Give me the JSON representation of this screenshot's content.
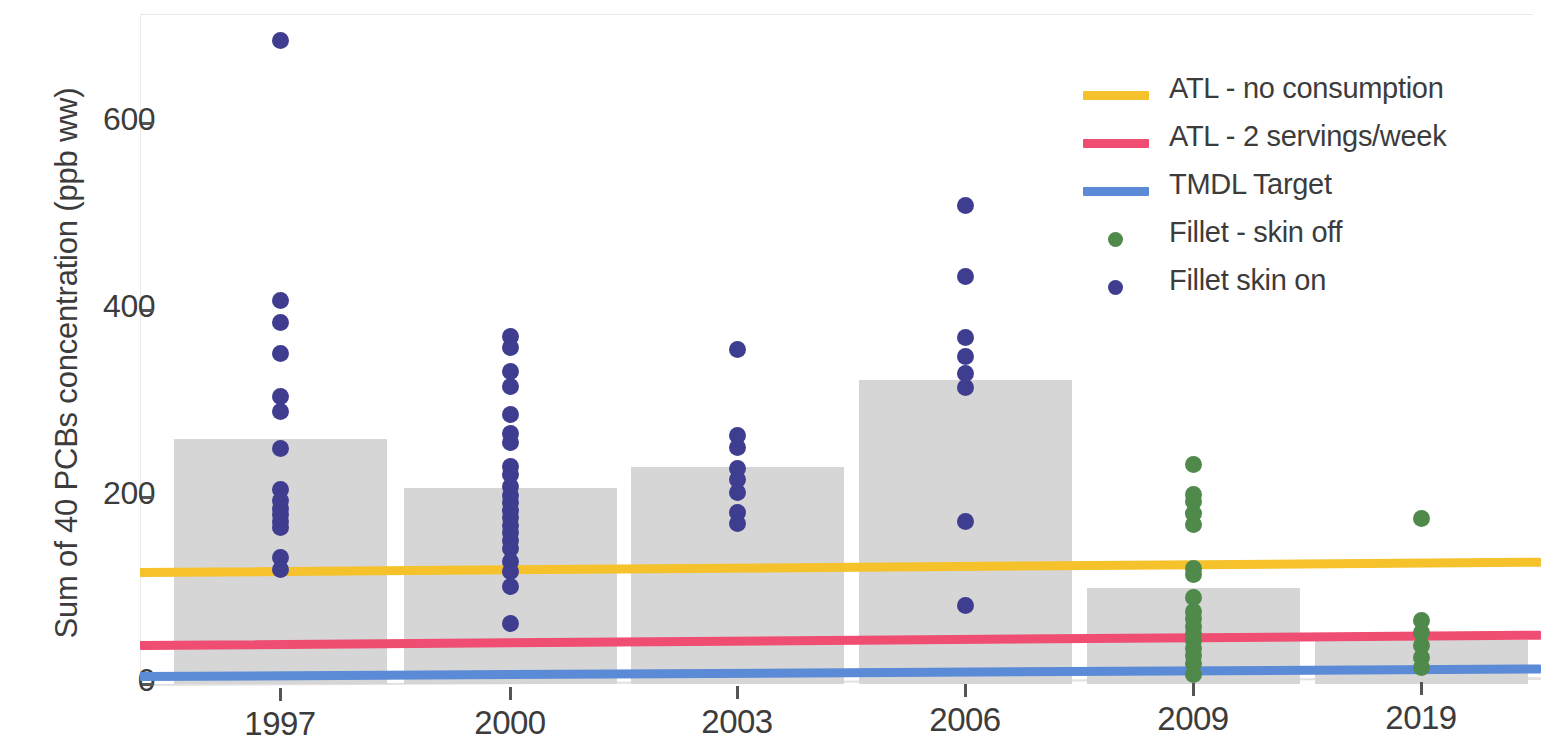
{
  "chart_data": {
    "type": "bar",
    "title": "",
    "xlabel": "",
    "ylabel": "Sum of 40 PCBs concentration (ppb ww)",
    "categories": [
      "1997",
      "2000",
      "2003",
      "2006",
      "2009",
      "2019"
    ],
    "values": [
      262,
      210,
      232,
      325,
      103,
      47
    ],
    "ylim": [
      0,
      700
    ],
    "yticks": [
      0,
      200,
      400,
      600
    ],
    "ytick_labels": [
      "0",
      "200",
      "400",
      "600"
    ],
    "grid": false,
    "legend_position": "top-right",
    "bar_color": "#d4d4d4",
    "series": [
      {
        "name": "Bar - mean concentration",
        "type": "bar",
        "categories": [
          "1997",
          "2000",
          "2003",
          "2006",
          "2009",
          "2019"
        ],
        "values": [
          262,
          210,
          232,
          325,
          103,
          47
        ]
      },
      {
        "name": "Fillet skin on",
        "type": "scatter",
        "color": "#3f3d8f",
        "points": [
          {
            "x": "1997",
            "y": 688
          },
          {
            "x": "1997",
            "y": 410
          },
          {
            "x": "1997",
            "y": 387
          },
          {
            "x": "1997",
            "y": 353
          },
          {
            "x": "1997",
            "y": 307
          },
          {
            "x": "1997",
            "y": 291
          },
          {
            "x": "1997",
            "y": 252
          },
          {
            "x": "1997",
            "y": 208
          },
          {
            "x": "1997",
            "y": 196
          },
          {
            "x": "1997",
            "y": 188
          },
          {
            "x": "1997",
            "y": 181
          },
          {
            "x": "1997",
            "y": 174
          },
          {
            "x": "1997",
            "y": 167
          },
          {
            "x": "1997",
            "y": 135
          },
          {
            "x": "1997",
            "y": 122
          },
          {
            "x": "2000",
            "y": 372
          },
          {
            "x": "2000",
            "y": 360
          },
          {
            "x": "2000",
            "y": 334
          },
          {
            "x": "2000",
            "y": 318
          },
          {
            "x": "2000",
            "y": 288
          },
          {
            "x": "2000",
            "y": 268
          },
          {
            "x": "2000",
            "y": 258
          },
          {
            "x": "2000",
            "y": 233
          },
          {
            "x": "2000",
            "y": 224
          },
          {
            "x": "2000",
            "y": 211
          },
          {
            "x": "2000",
            "y": 202
          },
          {
            "x": "2000",
            "y": 194
          },
          {
            "x": "2000",
            "y": 186
          },
          {
            "x": "2000",
            "y": 178
          },
          {
            "x": "2000",
            "y": 170
          },
          {
            "x": "2000",
            "y": 162
          },
          {
            "x": "2000",
            "y": 154
          },
          {
            "x": "2000",
            "y": 145
          },
          {
            "x": "2000",
            "y": 131
          },
          {
            "x": "2000",
            "y": 120
          },
          {
            "x": "2000",
            "y": 104
          },
          {
            "x": "2000",
            "y": 65
          },
          {
            "x": "2003",
            "y": 358
          },
          {
            "x": "2003",
            "y": 266
          },
          {
            "x": "2003",
            "y": 253
          },
          {
            "x": "2003",
            "y": 231
          },
          {
            "x": "2003",
            "y": 219
          },
          {
            "x": "2003",
            "y": 205
          },
          {
            "x": "2003",
            "y": 183
          },
          {
            "x": "2003",
            "y": 172
          },
          {
            "x": "2006",
            "y": 512
          },
          {
            "x": "2006",
            "y": 436
          },
          {
            "x": "2006",
            "y": 371
          },
          {
            "x": "2006",
            "y": 350
          },
          {
            "x": "2006",
            "y": 332
          },
          {
            "x": "2006",
            "y": 317
          },
          {
            "x": "2006",
            "y": 174
          },
          {
            "x": "2006",
            "y": 84
          }
        ]
      },
      {
        "name": "Fillet - skin off",
        "type": "scatter",
        "color": "#4f8a4b",
        "points": [
          {
            "x": "2009",
            "y": 235
          },
          {
            "x": "2009",
            "y": 203
          },
          {
            "x": "2009",
            "y": 195
          },
          {
            "x": "2009",
            "y": 182
          },
          {
            "x": "2009",
            "y": 171
          },
          {
            "x": "2009",
            "y": 124
          },
          {
            "x": "2009",
            "y": 117
          },
          {
            "x": "2009",
            "y": 93
          },
          {
            "x": "2009",
            "y": 78
          },
          {
            "x": "2009",
            "y": 70
          },
          {
            "x": "2009",
            "y": 62
          },
          {
            "x": "2009",
            "y": 54
          },
          {
            "x": "2009",
            "y": 46
          },
          {
            "x": "2009",
            "y": 38
          },
          {
            "x": "2009",
            "y": 30
          },
          {
            "x": "2009",
            "y": 22
          },
          {
            "x": "2009",
            "y": 10
          },
          {
            "x": "2019",
            "y": 177
          },
          {
            "x": "2019",
            "y": 68
          },
          {
            "x": "2019",
            "y": 55
          },
          {
            "x": "2019",
            "y": 41
          },
          {
            "x": "2019",
            "y": 28
          },
          {
            "x": "2019",
            "y": 18
          }
        ]
      }
    ],
    "reference_lines": [
      {
        "name": "ATL - no consumption",
        "color": "#f5c22b",
        "value_left": 119,
        "value_right": 130
      },
      {
        "name": "ATL - 2 servings/week",
        "color": "#ef4d72",
        "value_left": 41,
        "value_right": 52
      },
      {
        "name": "TMDL Target",
        "color": "#5b8ad6",
        "value_left": 8,
        "value_right": 16
      }
    ]
  },
  "axes": {
    "y_title": "Sum of 40 PCBs concentration (ppb ww)",
    "y_ticks": [
      "600",
      "400",
      "200",
      "0"
    ],
    "x_ticks": [
      "1997",
      "2000",
      "2003",
      "2006",
      "2009",
      "2019"
    ]
  },
  "legend": {
    "items": [
      {
        "label": "ATL - no consumption",
        "marker": "line",
        "color": "#f5c22b"
      },
      {
        "label": "ATL - 2 servings/week",
        "marker": "line",
        "color": "#ef4d72"
      },
      {
        "label": "TMDL Target",
        "marker": "line",
        "color": "#5b8ad6"
      },
      {
        "label": "Fillet - skin off",
        "marker": "dot",
        "color": "#4f8a4b"
      },
      {
        "label": "Fillet skin on",
        "marker": "dot",
        "color": "#3f3d8f"
      }
    ]
  }
}
